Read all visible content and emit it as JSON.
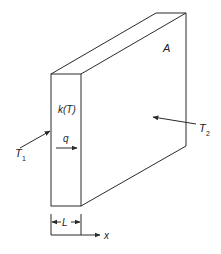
{
  "diagram": {
    "title": "",
    "labels": {
      "area": "A",
      "conductivity": "k(T)",
      "heat_flux": "q",
      "temp_left": "T",
      "temp_left_sub": "1",
      "temp_right": "T",
      "temp_right_sub": "2",
      "thickness": "L",
      "axis": "x"
    },
    "colors": {
      "stroke": "#2a2a2a",
      "background": "#ffffff"
    }
  }
}
